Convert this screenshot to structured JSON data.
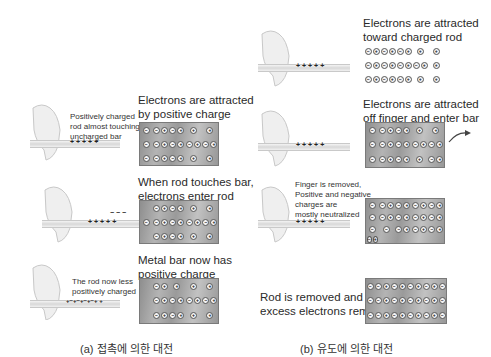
{
  "panel_a": {
    "caption": "(a) 접촉에 의한 대전",
    "steps": [
      {
        "rod_label": [
          "Positively charged",
          "rod almost touching",
          "uncharged bar"
        ],
        "bar_label": [
          "Electrons are attracted",
          "by positive charge"
        ],
        "rod_charges": "+ + + + +",
        "bar_rows": [
          [
            "−",
            "−+",
            "−+",
            "+",
            "+"
          ],
          [
            "−",
            "−+",
            "−+",
            "−+",
            "−+"
          ],
          [
            "−",
            "−+",
            "−+",
            "+",
            "+"
          ]
        ]
      },
      {
        "bar_label": [
          "When rod touches bar,",
          "electrons enter rod"
        ],
        "rod_charges": "+ + + + +",
        "rod_electrons": "− − −",
        "bar_rows": [
          [
            "",
            "−+",
            "−+",
            "+",
            "+"
          ],
          [
            "−",
            "−+",
            "−+",
            "−+",
            "−+"
          ],
          [
            "",
            "−+",
            "−+",
            "+",
            "+"
          ]
        ]
      },
      {
        "rod_label": [
          "The rod now less",
          "positively charged"
        ],
        "bar_label": [
          "Metal bar now has",
          "positive charge"
        ],
        "rod_charges": "+−+−+−+−+ +",
        "bar_rows": [
          [
            "",
            "−+",
            "+",
            "+",
            "+"
          ],
          [
            "",
            "−+",
            "−+",
            "−+",
            "−+"
          ],
          [
            "",
            "−+",
            "−+",
            "+",
            "+"
          ]
        ]
      }
    ]
  },
  "panel_b": {
    "caption": "(b) 유도에 의한 대전",
    "steps": [
      {
        "bar_label": [
          "Electrons are attracted",
          "toward charged rod"
        ],
        "rod_charges": "+ + + + +",
        "bar_rows": [
          [
            "−+",
            "−+",
            "−+",
            "+",
            "+"
          ],
          [
            "−+",
            "−+",
            "−+",
            "−+",
            "+"
          ],
          [
            "−+",
            "−+",
            "−+",
            "+",
            "+"
          ]
        ]
      },
      {
        "bar_label": [
          "Electrons are attracted",
          "off finger and enter bar"
        ],
        "rod_charges": "+ + + + +",
        "bar_rows": [
          [
            "−",
            "−+",
            "−+",
            "+",
            "+"
          ],
          [
            "−",
            "−+",
            "−+",
            "−+",
            "−+"
          ],
          [
            "−",
            "−+",
            "−+",
            "+",
            "−+"
          ]
        ]
      },
      {
        "rod_label": [
          "Finger is removed,",
          "Positive and negative",
          "charges are",
          "mostly neutralized"
        ],
        "rod_charges": "+ + + + +",
        "bar_rows": [
          [
            "−",
            "−+",
            "−+",
            "−+",
            "−+"
          ],
          [
            "−",
            "−+",
            "−+",
            "−+",
            "−+",
            "−"
          ],
          [
            "−",
            "−+",
            "−+",
            "−+",
            "−+"
          ]
        ]
      },
      {
        "rod_label": [
          "Rod is removed and",
          "excess electrons remain"
        ],
        "bar_rows": [
          [
            "−",
            "−+",
            "−+",
            "−+",
            "−+",
            "−"
          ],
          [
            "−",
            "−+",
            "−+",
            "−+",
            "−+",
            "−"
          ],
          [
            "−",
            "−+",
            "−+",
            "−+",
            "−+",
            "−"
          ]
        ]
      }
    ]
  }
}
